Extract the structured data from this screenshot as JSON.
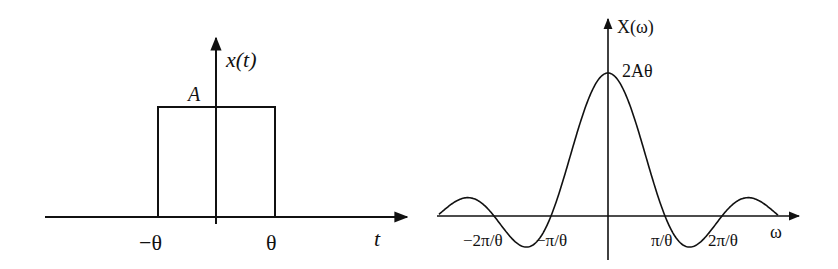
{
  "left_plot": {
    "title": "Rectangular pulse x(t)",
    "y_label": "x(t)",
    "x_label": "t",
    "amplitude_label": "A",
    "ticks": [
      "−θ",
      "θ"
    ]
  },
  "right_plot": {
    "title": "Fourier transform X(ω)",
    "y_label": "X(ω)",
    "x_label": "ω",
    "peak_label": "2Aθ",
    "ticks": [
      "−2π/θ",
      "−π/θ",
      "π/θ",
      "2π/θ"
    ]
  },
  "colors": {
    "line": "#111111",
    "background": "#ffffff"
  }
}
